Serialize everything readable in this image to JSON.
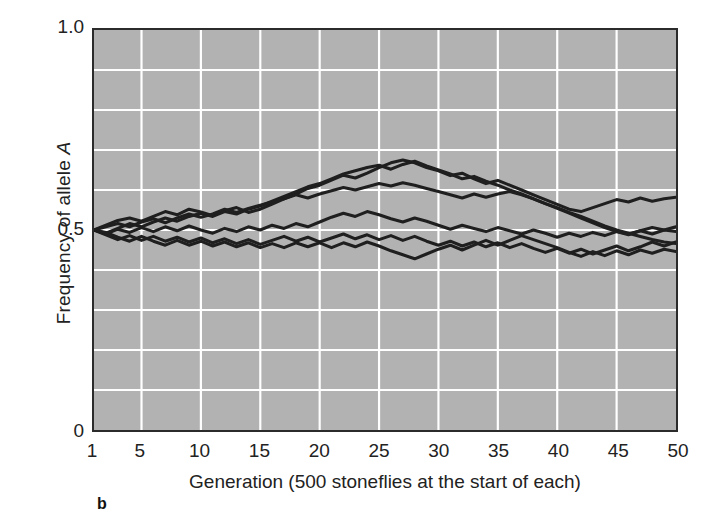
{
  "figure": {
    "panel_label": "b",
    "background_color": "#ffffff",
    "plot_background_color": "#b2b2b2",
    "gridline_color": "#ffffff",
    "line_color": "#1f1f1f",
    "axis_color": "#2b2b2b"
  },
  "chart_data": {
    "type": "line",
    "title": "",
    "subtitle": "",
    "xlabel": "Generation (500 stoneflies at the start of each)",
    "ylabel": "Frequency of allele A",
    "ylabel_plain": "Frequency of allele ",
    "ylabel_italic": "A",
    "xlim": [
      1,
      50
    ],
    "ylim": [
      0,
      1.0
    ],
    "grid": true,
    "grid_x_step": 5,
    "grid_y_step": 0.1,
    "legend": "none",
    "legend_position": "none",
    "xtick_labels": [
      "1",
      "5",
      "10",
      "15",
      "20",
      "25",
      "30",
      "35",
      "40",
      "45",
      "50"
    ],
    "xtick_values": [
      1,
      5,
      10,
      15,
      20,
      25,
      30,
      35,
      40,
      45,
      50
    ],
    "ytick_labels": [
      "1.0",
      "0.5",
      "0"
    ],
    "ytick_values": [
      1.0,
      0.5,
      0.0
    ],
    "x": [
      1,
      2,
      3,
      4,
      5,
      6,
      7,
      8,
      9,
      10,
      11,
      12,
      13,
      14,
      15,
      16,
      17,
      18,
      19,
      20,
      21,
      22,
      23,
      24,
      25,
      26,
      27,
      28,
      29,
      30,
      31,
      32,
      33,
      34,
      35,
      36,
      37,
      38,
      39,
      40,
      41,
      42,
      43,
      44,
      45,
      46,
      47,
      48,
      49,
      50
    ],
    "series": [
      {
        "name": "Replicate 1",
        "values": [
          0.5,
          0.512,
          0.524,
          0.53,
          0.522,
          0.534,
          0.546,
          0.538,
          0.552,
          0.545,
          0.536,
          0.548,
          0.556,
          0.544,
          0.552,
          0.565,
          0.578,
          0.59,
          0.604,
          0.612,
          0.625,
          0.637,
          0.63,
          0.642,
          0.656,
          0.668,
          0.675,
          0.668,
          0.656,
          0.648,
          0.636,
          0.642,
          0.628,
          0.616,
          0.624,
          0.612,
          0.6,
          0.588,
          0.576,
          0.564,
          0.552,
          0.546,
          0.556,
          0.566,
          0.576,
          0.57,
          0.58,
          0.572,
          0.578,
          0.582
        ]
      },
      {
        "name": "Replicate 2",
        "values": [
          0.5,
          0.492,
          0.504,
          0.516,
          0.508,
          0.52,
          0.53,
          0.522,
          0.534,
          0.542,
          0.534,
          0.546,
          0.54,
          0.552,
          0.56,
          0.572,
          0.584,
          0.596,
          0.608,
          0.616,
          0.628,
          0.64,
          0.648,
          0.656,
          0.662,
          0.652,
          0.664,
          0.672,
          0.66,
          0.65,
          0.64,
          0.628,
          0.634,
          0.622,
          0.612,
          0.6,
          0.59,
          0.578,
          0.566,
          0.554,
          0.542,
          0.53,
          0.518,
          0.506,
          0.496,
          0.49,
          0.498,
          0.506,
          0.5,
          0.508
        ]
      },
      {
        "name": "Replicate 3",
        "values": [
          0.5,
          0.508,
          0.516,
          0.508,
          0.52,
          0.528,
          0.518,
          0.53,
          0.54,
          0.532,
          0.54,
          0.552,
          0.544,
          0.554,
          0.562,
          0.57,
          0.578,
          0.588,
          0.58,
          0.59,
          0.598,
          0.606,
          0.6,
          0.608,
          0.616,
          0.61,
          0.618,
          0.612,
          0.604,
          0.596,
          0.588,
          0.58,
          0.59,
          0.582,
          0.59,
          0.596,
          0.588,
          0.578,
          0.566,
          0.556,
          0.544,
          0.534,
          0.522,
          0.51,
          0.5,
          0.492,
          0.484,
          0.476,
          0.47,
          0.466
        ]
      },
      {
        "name": "Replicate 4",
        "values": [
          0.5,
          0.49,
          0.502,
          0.494,
          0.506,
          0.496,
          0.508,
          0.498,
          0.51,
          0.5,
          0.492,
          0.504,
          0.496,
          0.508,
          0.5,
          0.512,
          0.504,
          0.516,
          0.508,
          0.52,
          0.532,
          0.542,
          0.534,
          0.546,
          0.538,
          0.528,
          0.52,
          0.53,
          0.522,
          0.512,
          0.502,
          0.512,
          0.504,
          0.496,
          0.506,
          0.498,
          0.49,
          0.5,
          0.492,
          0.482,
          0.492,
          0.484,
          0.494,
          0.486,
          0.496,
          0.488,
          0.498,
          0.49,
          0.5,
          0.496
        ]
      },
      {
        "name": "Replicate 5",
        "values": [
          0.5,
          0.488,
          0.476,
          0.486,
          0.474,
          0.484,
          0.472,
          0.482,
          0.47,
          0.48,
          0.468,
          0.478,
          0.466,
          0.476,
          0.464,
          0.474,
          0.484,
          0.472,
          0.482,
          0.47,
          0.48,
          0.49,
          0.478,
          0.488,
          0.476,
          0.486,
          0.474,
          0.484,
          0.472,
          0.462,
          0.472,
          0.46,
          0.47,
          0.458,
          0.468,
          0.456,
          0.466,
          0.454,
          0.444,
          0.454,
          0.442,
          0.452,
          0.44,
          0.45,
          0.46,
          0.448,
          0.458,
          0.47,
          0.46,
          0.47
        ]
      },
      {
        "name": "Replicate 6",
        "values": [
          0.5,
          0.494,
          0.482,
          0.472,
          0.484,
          0.472,
          0.462,
          0.474,
          0.462,
          0.472,
          0.46,
          0.47,
          0.458,
          0.468,
          0.456,
          0.466,
          0.456,
          0.468,
          0.458,
          0.468,
          0.456,
          0.468,
          0.458,
          0.47,
          0.46,
          0.448,
          0.438,
          0.428,
          0.44,
          0.452,
          0.462,
          0.45,
          0.462,
          0.474,
          0.462,
          0.474,
          0.486,
          0.476,
          0.466,
          0.456,
          0.444,
          0.434,
          0.446,
          0.436,
          0.448,
          0.438,
          0.45,
          0.442,
          0.452,
          0.446
        ]
      }
    ]
  }
}
